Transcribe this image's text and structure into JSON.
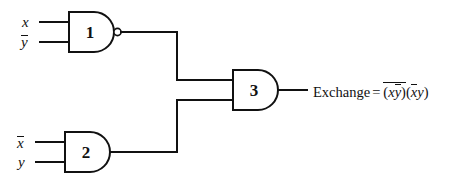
{
  "diagram": {
    "line_color": "#111111",
    "background_color": "#ffffff"
  },
  "gates": [
    {
      "id": "gate-1",
      "number": "1",
      "type": "NAND",
      "inverted_output": true,
      "inputs": [
        {
          "label_plain": "x",
          "overbar": false
        },
        {
          "label_plain": "y",
          "overbar": true
        }
      ]
    },
    {
      "id": "gate-2",
      "number": "2",
      "type": "AND",
      "inverted_output": false,
      "inputs": [
        {
          "label_plain": "x",
          "overbar": true
        },
        {
          "label_plain": "y",
          "overbar": false
        }
      ]
    },
    {
      "id": "gate-3",
      "number": "3",
      "type": "AND",
      "inverted_output": false,
      "inputs": [
        {
          "label_plain": "gate-1 output",
          "overbar": false
        },
        {
          "label_plain": "gate-2 output",
          "overbar": false
        }
      ]
    }
  ],
  "input_labels": {
    "gate1_top": "x",
    "gate1_bottom": "y",
    "gate2_top": "x",
    "gate2_bottom": "y"
  },
  "output": {
    "name": "Exchange",
    "equals": "=",
    "expression_plain": "Exchange = (x y-bar)-bar (x-bar y)",
    "term1": {
      "open": "(",
      "var1": "x",
      "var2": "y",
      "close": ")"
    },
    "term2": {
      "open": "(",
      "var1": "x",
      "var2": "y",
      "close": ")"
    }
  }
}
